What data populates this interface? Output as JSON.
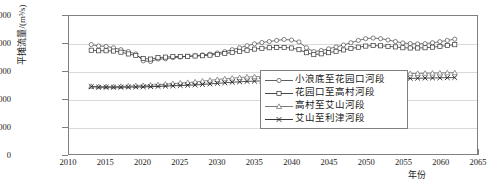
{
  "chart_data": {
    "type": "line",
    "title": "",
    "xlabel": "年份",
    "ylabel": "平摊流量/(m³/s)",
    "xlim": [
      2010,
      2065
    ],
    "ylim": [
      0,
      10000
    ],
    "xticks": [
      2010,
      2015,
      2020,
      2025,
      2030,
      2035,
      2040,
      2045,
      2050,
      2055,
      2060,
      2065
    ],
    "yticks": [
      0,
      2000,
      4000,
      6000,
      8000,
      10000
    ],
    "grid": true,
    "legend_position": "bottom-right-inside",
    "x": [
      2013,
      2014,
      2015,
      2016,
      2017,
      2018,
      2019,
      2020,
      2021,
      2022,
      2023,
      2024,
      2025,
      2026,
      2027,
      2028,
      2029,
      2030,
      2031,
      2032,
      2033,
      2034,
      2035,
      2036,
      2037,
      2038,
      2039,
      2040,
      2041,
      2042,
      2043,
      2044,
      2045,
      2046,
      2047,
      2048,
      2049,
      2050,
      2051,
      2052,
      2053,
      2054,
      2055,
      2056,
      2057,
      2058,
      2059,
      2060,
      2061,
      2062
    ],
    "series": [
      {
        "name": "小浪底至花园口河段",
        "marker": "circle",
        "color": "#4d4d4d",
        "values": [
          7930,
          7830,
          7800,
          7700,
          7560,
          7420,
          7250,
          6750,
          6700,
          6880,
          6900,
          6980,
          7020,
          7080,
          7120,
          7180,
          7240,
          7320,
          7420,
          7560,
          7700,
          7850,
          7980,
          8080,
          8150,
          8230,
          8300,
          8260,
          8120,
          7700,
          7420,
          7500,
          7620,
          7760,
          7900,
          8060,
          8230,
          8360,
          8400,
          8360,
          8260,
          8150,
          8050,
          8000,
          7980,
          8000,
          8060,
          8140,
          8230,
          8320
        ]
      },
      {
        "name": "花园口至高村河段",
        "marker": "square",
        "color": "#333333",
        "values": [
          7520,
          7480,
          7480,
          7460,
          7380,
          7250,
          7140,
          6920,
          6880,
          6980,
          7020,
          7060,
          7060,
          7080,
          7100,
          7120,
          7160,
          7220,
          7280,
          7360,
          7440,
          7520,
          7600,
          7660,
          7700,
          7720,
          7720,
          7680,
          7560,
          7340,
          7200,
          7260,
          7340,
          7440,
          7540,
          7640,
          7740,
          7820,
          7860,
          7840,
          7800,
          7760,
          7700,
          7680,
          7680,
          7700,
          7740,
          7800,
          7860,
          7920
        ]
      },
      {
        "name": "高村至艾山河段",
        "marker": "triangle",
        "color": "#6b6b6b",
        "values": [
          4900,
          4880,
          4880,
          4880,
          4900,
          4920,
          4940,
          4960,
          4990,
          5020,
          5060,
          5100,
          5140,
          5180,
          5220,
          5280,
          5340,
          5400,
          5450,
          5500,
          5540,
          5580,
          5600,
          5620,
          5640,
          5650,
          5660,
          5660,
          5650,
          5640,
          5630,
          5640,
          5660,
          5680,
          5700,
          5720,
          5740,
          5760,
          5780,
          5790,
          5800,
          5810,
          5820,
          5830,
          5840,
          5850,
          5860,
          5870,
          5880,
          5890
        ]
      },
      {
        "name": "艾山至利津河段",
        "marker": "cross",
        "color": "#222222",
        "values": [
          4880,
          4840,
          4840,
          4840,
          4840,
          4850,
          4860,
          4870,
          4880,
          4900,
          4920,
          4940,
          4960,
          4980,
          5000,
          5040,
          5080,
          5120,
          5160,
          5200,
          5230,
          5260,
          5280,
          5300,
          5310,
          5320,
          5320,
          5310,
          5300,
          5280,
          5260,
          5250,
          5250,
          5260,
          5280,
          5310,
          5340,
          5370,
          5400,
          5420,
          5440,
          5460,
          5470,
          5480,
          5490,
          5500,
          5510,
          5520,
          5530,
          5540
        ]
      }
    ]
  }
}
